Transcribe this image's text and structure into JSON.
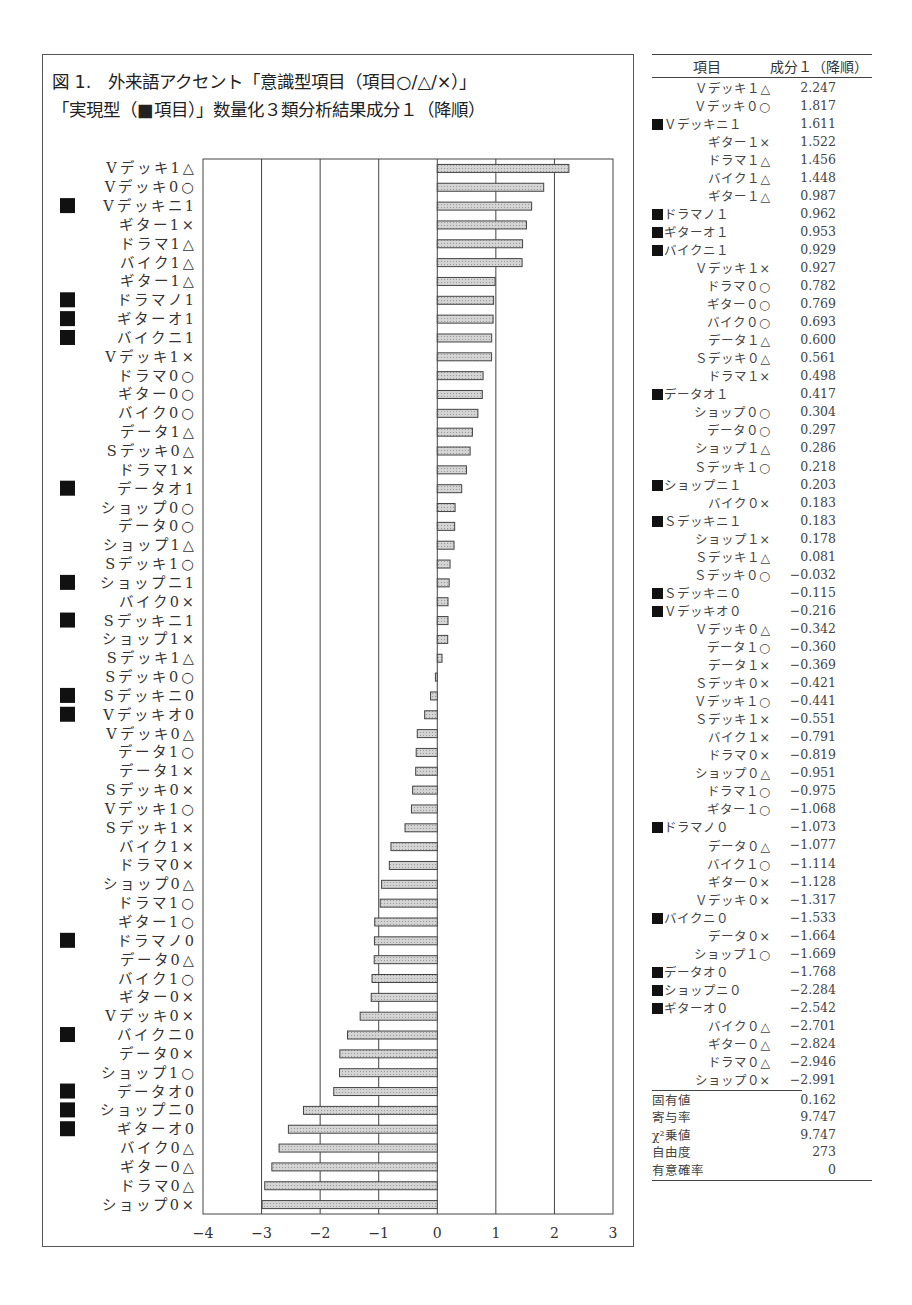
{
  "title": {
    "line1": "図 1.　外来語アクセント「意識型項目（項目○/△/×）」",
    "line2": "「実現型（■項目）」数量化３類分析結果成分１（降順）"
  },
  "chart_data": {
    "type": "bar",
    "orientation": "horizontal",
    "xlabel": "",
    "ylabel": "",
    "xlim": [
      -4,
      3
    ],
    "xticks": [
      "−4",
      "−3",
      "−2",
      "−1",
      "0",
      "1",
      "2",
      "3"
    ],
    "xtick_values": [
      -4,
      -3,
      -2,
      -1,
      0,
      1,
      2,
      3
    ],
    "grid": "vertical",
    "categories": [
      {
        "label": "Vデッキ1△",
        "real": false
      },
      {
        "label": "Vデッキ0○",
        "real": false
      },
      {
        "label": "Vデッキニ1",
        "real": true
      },
      {
        "label": "ギター1×",
        "real": false
      },
      {
        "label": "ドラマ1△",
        "real": false
      },
      {
        "label": "バイク1△",
        "real": false
      },
      {
        "label": "ギター1△",
        "real": false
      },
      {
        "label": "ドラマノ1",
        "real": true
      },
      {
        "label": "ギターオ1",
        "real": true
      },
      {
        "label": "バイクニ1",
        "real": true
      },
      {
        "label": "Vデッキ1×",
        "real": false
      },
      {
        "label": "ドラマ0○",
        "real": false
      },
      {
        "label": "ギター0○",
        "real": false
      },
      {
        "label": "バイク0○",
        "real": false
      },
      {
        "label": "データ1△",
        "real": false
      },
      {
        "label": "Sデッキ0△",
        "real": false
      },
      {
        "label": "ドラマ1×",
        "real": false
      },
      {
        "label": "データオ1",
        "real": true
      },
      {
        "label": "ショップ0○",
        "real": false
      },
      {
        "label": "データ0○",
        "real": false
      },
      {
        "label": "ショップ1△",
        "real": false
      },
      {
        "label": "Sデッキ1○",
        "real": false
      },
      {
        "label": "ショップニ1",
        "real": true
      },
      {
        "label": "バイク0×",
        "real": false
      },
      {
        "label": "Sデッキニ1",
        "real": true
      },
      {
        "label": "ショップ1×",
        "real": false
      },
      {
        "label": "Sデッキ1△",
        "real": false
      },
      {
        "label": "Sデッキ0○",
        "real": false
      },
      {
        "label": "Sデッキニ0",
        "real": true
      },
      {
        "label": "Vデッキオ0",
        "real": true
      },
      {
        "label": "Vデッキ0△",
        "real": false
      },
      {
        "label": "データ1○",
        "real": false
      },
      {
        "label": "データ1×",
        "real": false
      },
      {
        "label": "Sデッキ0×",
        "real": false
      },
      {
        "label": "Vデッキ1○",
        "real": false
      },
      {
        "label": "Sデッキ1×",
        "real": false
      },
      {
        "label": "バイク1×",
        "real": false
      },
      {
        "label": "ドラマ0×",
        "real": false
      },
      {
        "label": "ショップ0△",
        "real": false
      },
      {
        "label": "ドラマ1○",
        "real": false
      },
      {
        "label": "ギター1○",
        "real": false
      },
      {
        "label": "ドラマノ0",
        "real": true
      },
      {
        "label": "データ0△",
        "real": false
      },
      {
        "label": "バイク1○",
        "real": false
      },
      {
        "label": "ギター0×",
        "real": false
      },
      {
        "label": "Vデッキ0×",
        "real": false
      },
      {
        "label": "バイクニ0",
        "real": true
      },
      {
        "label": "データ0×",
        "real": false
      },
      {
        "label": "ショップ1○",
        "real": false
      },
      {
        "label": "データオ0",
        "real": true
      },
      {
        "label": "ショップニ0",
        "real": true
      },
      {
        "label": "ギターオ0",
        "real": true
      },
      {
        "label": "バイク0△",
        "real": false
      },
      {
        "label": "ギター0△",
        "real": false
      },
      {
        "label": "ドラマ0△",
        "real": false
      },
      {
        "label": "ショップ0×",
        "real": false
      }
    ],
    "values": [
      2.247,
      1.817,
      1.611,
      1.522,
      1.456,
      1.448,
      0.987,
      0.962,
      0.953,
      0.929,
      0.927,
      0.782,
      0.769,
      0.693,
      0.6,
      0.561,
      0.498,
      0.417,
      0.304,
      0.297,
      0.286,
      0.218,
      0.203,
      0.183,
      0.183,
      0.178,
      0.081,
      -0.032,
      -0.115,
      -0.216,
      -0.342,
      -0.36,
      -0.369,
      -0.421,
      -0.441,
      -0.551,
      -0.791,
      -0.819,
      -0.951,
      -0.975,
      -1.068,
      -1.073,
      -1.077,
      -1.114,
      -1.128,
      -1.317,
      -1.533,
      -1.664,
      -1.669,
      -1.768,
      -2.284,
      -2.542,
      -2.701,
      -2.824,
      -2.946,
      -2.991
    ]
  },
  "table": {
    "header": {
      "item": "項目",
      "value": "成分１（降順）"
    },
    "rows": [
      {
        "name": "Ｖデッキ１△",
        "real": false,
        "value": "2.247"
      },
      {
        "name": "Ｖデッキ０○",
        "real": false,
        "value": "1.817"
      },
      {
        "name": "Ｖデッキニ１",
        "real": true,
        "value": "1.611"
      },
      {
        "name": "ギター１×",
        "real": false,
        "value": "1.522"
      },
      {
        "name": "ドラマ１△",
        "real": false,
        "value": "1.456"
      },
      {
        "name": "バイク１△",
        "real": false,
        "value": "1.448"
      },
      {
        "name": "ギター１△",
        "real": false,
        "value": "0.987"
      },
      {
        "name": "ドラマノ１",
        "real": true,
        "value": "0.962"
      },
      {
        "name": "ギターオ１",
        "real": true,
        "value": "0.953"
      },
      {
        "name": "バイクニ１",
        "real": true,
        "value": "0.929"
      },
      {
        "name": "Ｖデッキ１×",
        "real": false,
        "value": "0.927"
      },
      {
        "name": "ドラマ０○",
        "real": false,
        "value": "0.782"
      },
      {
        "name": "ギター０○",
        "real": false,
        "value": "0.769"
      },
      {
        "name": "バイク０○",
        "real": false,
        "value": "0.693"
      },
      {
        "name": "データ１△",
        "real": false,
        "value": "0.600"
      },
      {
        "name": "Ｓデッキ０△",
        "real": false,
        "value": "0.561"
      },
      {
        "name": "ドラマ１×",
        "real": false,
        "value": "0.498"
      },
      {
        "name": "データオ１",
        "real": true,
        "value": "0.417"
      },
      {
        "name": "ショップ０○",
        "real": false,
        "value": "0.304"
      },
      {
        "name": "データ０○",
        "real": false,
        "value": "0.297"
      },
      {
        "name": "ショップ１△",
        "real": false,
        "value": "0.286"
      },
      {
        "name": "Ｓデッキ１○",
        "real": false,
        "value": "0.218"
      },
      {
        "name": "ショップニ１",
        "real": true,
        "value": "0.203"
      },
      {
        "name": "バイク０×",
        "real": false,
        "value": "0.183"
      },
      {
        "name": "Ｓデッキニ１",
        "real": true,
        "value": "0.183"
      },
      {
        "name": "ショップ１×",
        "real": false,
        "value": "0.178"
      },
      {
        "name": "Ｓデッキ１△",
        "real": false,
        "value": "0.081"
      },
      {
        "name": "Ｓデッキ０○",
        "real": false,
        "value": "−0.032"
      },
      {
        "name": "Ｓデッキニ０",
        "real": true,
        "value": "−0.115"
      },
      {
        "name": "Ｖデッキオ０",
        "real": true,
        "value": "−0.216"
      },
      {
        "name": "Ｖデッキ０△",
        "real": false,
        "value": "−0.342"
      },
      {
        "name": "データ１○",
        "real": false,
        "value": "−0.360"
      },
      {
        "name": "データ１×",
        "real": false,
        "value": "−0.369"
      },
      {
        "name": "Ｓデッキ０×",
        "real": false,
        "value": "−0.421"
      },
      {
        "name": "Ｖデッキ１○",
        "real": false,
        "value": "−0.441"
      },
      {
        "name": "Ｓデッキ１×",
        "real": false,
        "value": "−0.551"
      },
      {
        "name": "バイク１×",
        "real": false,
        "value": "−0.791"
      },
      {
        "name": "ドラマ０×",
        "real": false,
        "value": "−0.819"
      },
      {
        "name": "ショップ０△",
        "real": false,
        "value": "−0.951"
      },
      {
        "name": "ドラマ１○",
        "real": false,
        "value": "−0.975"
      },
      {
        "name": "ギター１○",
        "real": false,
        "value": "−1.068"
      },
      {
        "name": "ドラマノ０",
        "real": true,
        "value": "−1.073"
      },
      {
        "name": "データ０△",
        "real": false,
        "value": "−1.077"
      },
      {
        "name": "バイク１○",
        "real": false,
        "value": "−1.114"
      },
      {
        "name": "ギター０×",
        "real": false,
        "value": "−1.128"
      },
      {
        "name": "Ｖデッキ０×",
        "real": false,
        "value": "−1.317"
      },
      {
        "name": "バイクニ０",
        "real": true,
        "value": "−1.533"
      },
      {
        "name": "データ０×",
        "real": false,
        "value": "−1.664"
      },
      {
        "name": "ショップ１○",
        "real": false,
        "value": "−1.669"
      },
      {
        "name": "データオ０",
        "real": true,
        "value": "−1.768"
      },
      {
        "name": "ショップニ０",
        "real": true,
        "value": "−2.284"
      },
      {
        "name": "ギターオ０",
        "real": true,
        "value": "−2.542"
      },
      {
        "name": "バイク０△",
        "real": false,
        "value": "−2.701"
      },
      {
        "name": "ギター０△",
        "real": false,
        "value": "−2.824"
      },
      {
        "name": "ドラマ０△",
        "real": false,
        "value": "−2.946"
      },
      {
        "name": "ショップ０×",
        "real": false,
        "value": "−2.991"
      }
    ],
    "stats": [
      {
        "name": "固有値",
        "value": "0.162"
      },
      {
        "name": "寄与率",
        "value": "9.747"
      },
      {
        "name": "χ²乗値",
        "value": "9.747"
      },
      {
        "name": "自由度",
        "value": "273"
      },
      {
        "name": "有意確率",
        "value": "0"
      }
    ]
  },
  "colors": {
    "bar_fill": "#d4d4d4",
    "bar_stroke": "#444444",
    "grid": "#444444",
    "text": "#333333"
  }
}
